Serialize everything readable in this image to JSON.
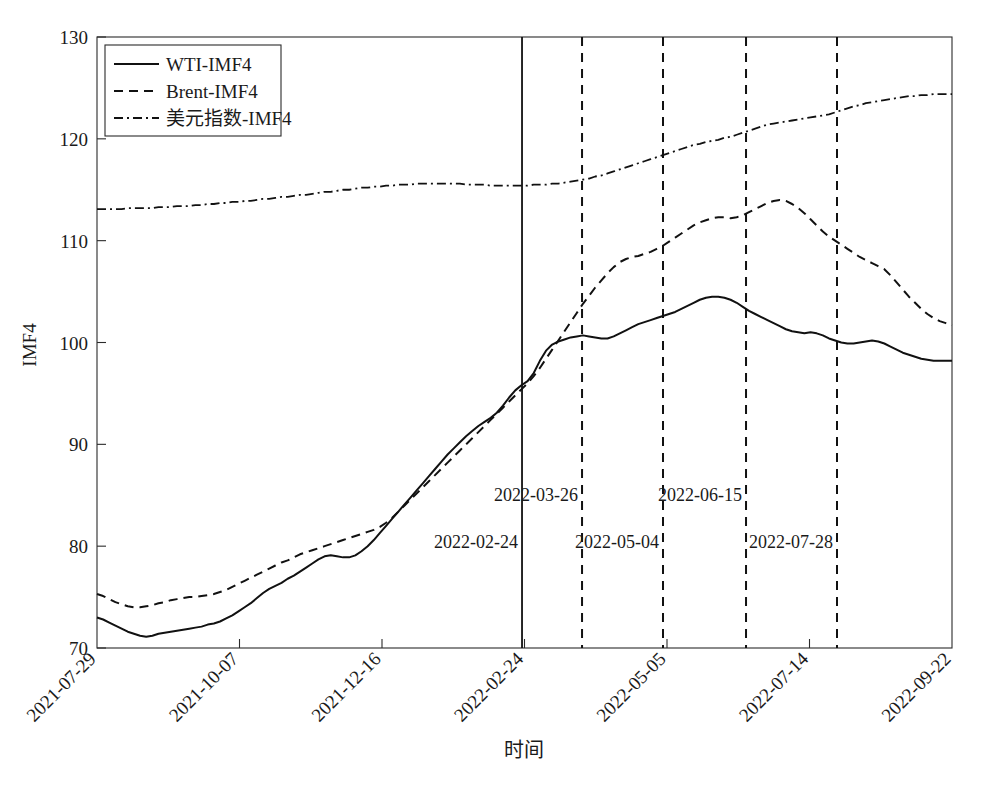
{
  "chart_data": {
    "type": "line",
    "title": "",
    "xlabel": "时间",
    "ylabel": "IMF4",
    "ylim": [
      70,
      130
    ],
    "yticks": [
      70,
      80,
      90,
      100,
      110,
      120,
      130
    ],
    "xticks": [
      "2021-07-29",
      "2021-10-07",
      "2021-12-16",
      "2022-02-24",
      "2022-05-05",
      "2022-07-14",
      "2022-09-22"
    ],
    "xtick_rotation": -45,
    "grid": false,
    "legend_position": "top-left",
    "series": [
      {
        "name": "WTI-IMF4",
        "style": "solid",
        "color": "#111111",
        "values": [
          73.0,
          72.8,
          72.5,
          72.2,
          71.9,
          71.6,
          71.4,
          71.2,
          71.1,
          71.2,
          71.4,
          71.5,
          71.6,
          71.7,
          71.8,
          71.9,
          72.0,
          72.1,
          72.3,
          72.4,
          72.6,
          72.9,
          73.2,
          73.6,
          74.0,
          74.4,
          74.9,
          75.4,
          75.8,
          76.1,
          76.4,
          76.8,
          77.1,
          77.5,
          77.9,
          78.3,
          78.7,
          79.0,
          79.1,
          79.0,
          78.9,
          78.9,
          79.1,
          79.5,
          80.0,
          80.6,
          81.3,
          82.0,
          82.7,
          83.4,
          84.1,
          84.8,
          85.5,
          86.2,
          86.9,
          87.6,
          88.3,
          89.0,
          89.6,
          90.2,
          90.8,
          91.3,
          91.8,
          92.2,
          92.6,
          93.1,
          93.8,
          94.6,
          95.3,
          95.8,
          96.2,
          97.0,
          98.2,
          99.2,
          99.8,
          100.1,
          100.3,
          100.5,
          100.6,
          100.7,
          100.6,
          100.5,
          100.4,
          100.4,
          100.6,
          100.9,
          101.2,
          101.5,
          101.8,
          102.0,
          102.2,
          102.4,
          102.6,
          102.8,
          103.0,
          103.3,
          103.6,
          103.9,
          104.2,
          104.4,
          104.5,
          104.5,
          104.4,
          104.2,
          103.9,
          103.5,
          103.1,
          102.8,
          102.5,
          102.2,
          101.9,
          101.6,
          101.3,
          101.1,
          101.0,
          100.9,
          101.0,
          100.9,
          100.7,
          100.4,
          100.2,
          100.0,
          99.9,
          99.9,
          100.0,
          100.1,
          100.2,
          100.1,
          99.9,
          99.6,
          99.3,
          99.0,
          98.8,
          98.6,
          98.4,
          98.3,
          98.2,
          98.2,
          98.2,
          98.2
        ]
      },
      {
        "name": "Brent-IMF4",
        "style": "dashed",
        "color": "#111111",
        "values": [
          75.3,
          75.1,
          74.8,
          74.5,
          74.3,
          74.1,
          74.0,
          74.0,
          74.1,
          74.2,
          74.4,
          74.5,
          74.7,
          74.8,
          74.9,
          75.0,
          75.0,
          75.1,
          75.2,
          75.3,
          75.5,
          75.7,
          76.0,
          76.3,
          76.6,
          76.9,
          77.2,
          77.5,
          77.8,
          78.1,
          78.4,
          78.6,
          78.9,
          79.2,
          79.4,
          79.6,
          79.8,
          80.0,
          80.2,
          80.4,
          80.6,
          80.8,
          81.0,
          81.2,
          81.4,
          81.6,
          81.9,
          82.3,
          82.8,
          83.4,
          84.0,
          84.6,
          85.2,
          85.8,
          86.4,
          87.0,
          87.6,
          88.2,
          88.8,
          89.4,
          90.0,
          90.6,
          91.2,
          91.8,
          92.4,
          93.0,
          93.6,
          94.2,
          94.8,
          95.4,
          96.0,
          96.7,
          97.5,
          98.4,
          99.3,
          100.2,
          101.1,
          102.0,
          102.9,
          103.8,
          104.6,
          105.4,
          106.1,
          106.8,
          107.4,
          107.9,
          108.2,
          108.4,
          108.5,
          108.7,
          108.9,
          109.2,
          109.5,
          109.9,
          110.3,
          110.7,
          111.1,
          111.5,
          111.8,
          112.0,
          112.2,
          112.3,
          112.3,
          112.2,
          112.3,
          112.5,
          112.8,
          113.1,
          113.4,
          113.7,
          113.9,
          114.0,
          113.9,
          113.6,
          113.2,
          112.7,
          112.1,
          111.5,
          110.9,
          110.4,
          110.0,
          109.6,
          109.2,
          108.8,
          108.4,
          108.1,
          107.8,
          107.5,
          107.2,
          106.6,
          105.9,
          105.2,
          104.5,
          103.9,
          103.3,
          102.8,
          102.4,
          102.1,
          101.9,
          101.7
        ]
      },
      {
        "name": "美元指数-IMF4",
        "style": "dashdot",
        "color": "#111111",
        "values": [
          113.1,
          113.1,
          113.1,
          113.1,
          113.1,
          113.2,
          113.2,
          113.2,
          113.2,
          113.2,
          113.3,
          113.3,
          113.3,
          113.4,
          113.4,
          113.4,
          113.5,
          113.5,
          113.6,
          113.6,
          113.7,
          113.7,
          113.8,
          113.8,
          113.9,
          113.9,
          114.0,
          114.1,
          114.1,
          114.2,
          114.3,
          114.3,
          114.4,
          114.5,
          114.5,
          114.6,
          114.7,
          114.8,
          114.8,
          114.9,
          115.0,
          115.0,
          115.1,
          115.2,
          115.2,
          115.3,
          115.3,
          115.4,
          115.4,
          115.5,
          115.5,
          115.5,
          115.6,
          115.6,
          115.6,
          115.6,
          115.6,
          115.6,
          115.6,
          115.6,
          115.5,
          115.5,
          115.5,
          115.5,
          115.4,
          115.4,
          115.4,
          115.4,
          115.4,
          115.4,
          115.4,
          115.5,
          115.5,
          115.5,
          115.6,
          115.6,
          115.7,
          115.8,
          115.9,
          116.0,
          116.1,
          116.3,
          116.4,
          116.6,
          116.8,
          117.0,
          117.2,
          117.4,
          117.6,
          117.8,
          118.0,
          118.2,
          118.4,
          118.6,
          118.8,
          119.0,
          119.2,
          119.4,
          119.5,
          119.7,
          119.8,
          119.9,
          120.1,
          120.2,
          120.4,
          120.6,
          120.8,
          121.0,
          121.2,
          121.4,
          121.5,
          121.6,
          121.7,
          121.8,
          121.9,
          122.0,
          122.1,
          122.2,
          122.3,
          122.4,
          122.6,
          122.8,
          123.0,
          123.2,
          123.3,
          123.5,
          123.6,
          123.7,
          123.8,
          123.9,
          124.0,
          124.1,
          124.2,
          124.2,
          124.3,
          124.3,
          124.4,
          124.4,
          124.4,
          124.4
        ]
      }
    ],
    "event_lines": [
      {
        "label": "2022-02-24",
        "style": "solid",
        "x_fraction": 0.4971,
        "label_row": 1,
        "label_anchor": "end"
      },
      {
        "label": "2022-03-26",
        "style": "dashed",
        "x_fraction": 0.5673,
        "label_row": 0,
        "label_anchor": "end"
      },
      {
        "label": "2022-05-04",
        "style": "dashed",
        "x_fraction": 0.662,
        "label_row": 1,
        "label_anchor": "end"
      },
      {
        "label": "2022-06-15",
        "style": "dashed",
        "x_fraction": 0.7591,
        "label_row": 0,
        "label_anchor": "end"
      },
      {
        "label": "2022-07-28",
        "style": "dashed",
        "x_fraction": 0.8655,
        "label_row": 1,
        "label_anchor": "end"
      }
    ]
  },
  "legend": {
    "items": [
      {
        "label": "WTI-IMF4",
        "style": "solid"
      },
      {
        "label": "Brent-IMF4",
        "style": "dashed"
      },
      {
        "label": "美元指数-IMF4",
        "style": "dashdot"
      }
    ]
  }
}
